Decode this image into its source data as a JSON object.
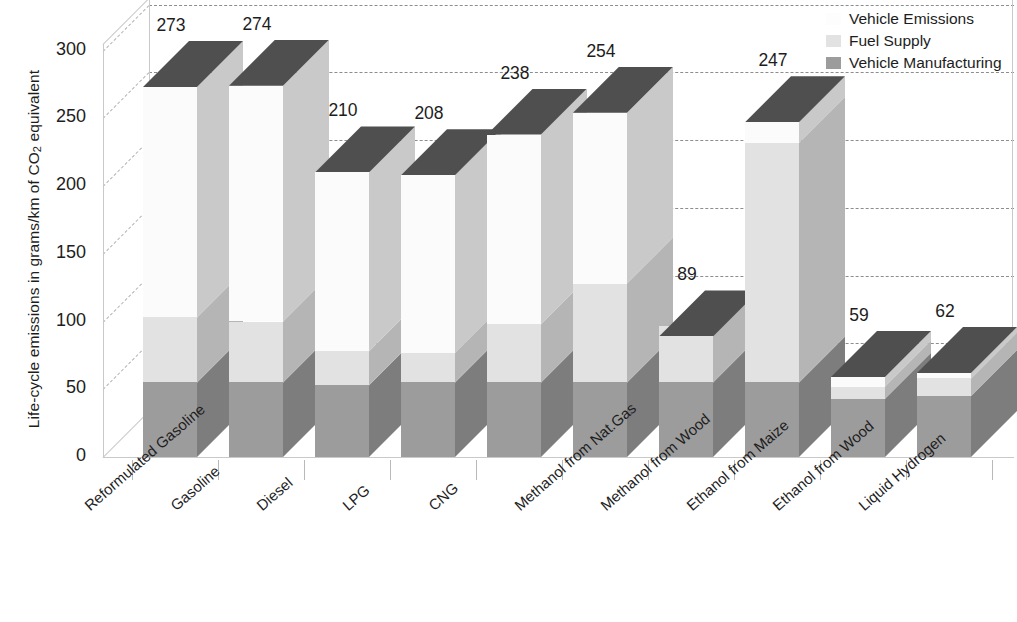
{
  "chart_data": {
    "type": "bar",
    "subtype": "stacked-3d-column",
    "title": "",
    "xlabel": "",
    "ylabel": "Life-cycle emissions in grams/km of CO2 equivalent",
    "ylabel_parts": {
      "pre": "Life-cycle emissions in grams/km of CO",
      "sub": "2",
      "post": " equivalent"
    },
    "ylim": [
      0,
      300
    ],
    "yticks": [
      0,
      50,
      100,
      150,
      200,
      250,
      300
    ],
    "ytick_labels": [
      "0",
      "50",
      "100",
      "150",
      "200",
      "250",
      "300"
    ],
    "grid": true,
    "grid_style": "dashed",
    "legend_position": "top-right",
    "categories": [
      "Reformulated Gasoline",
      "Gasoline",
      "Diesel",
      "LPG",
      "CNG",
      "Methanol from Nat.Gas",
      "Methanol from Wood",
      "Ethanol from Maize",
      "Ethanol from Wood",
      "Liquid Hydrogen"
    ],
    "series": [
      {
        "name": "Vehicle Manufacturing",
        "color": "#9c9c9c",
        "values": [
          55,
          55,
          53,
          55,
          55,
          55,
          55,
          55,
          43,
          45
        ]
      },
      {
        "name": "Fuel Supply",
        "color": "#e2e2e2",
        "values": [
          48,
          45,
          25,
          22,
          43,
          73,
          42,
          177,
          9,
          13
        ]
      },
      {
        "name": "Vehicle Emissions",
        "color": "#fbfbfb",
        "values": [
          170,
          174,
          132,
          131,
          140,
          126,
          -8,
          15,
          7,
          4
        ]
      }
    ],
    "totals": [
      273,
      274,
      210,
      208,
      238,
      254,
      89,
      247,
      59,
      62
    ],
    "total_labels": [
      "273",
      "274",
      "210",
      "208",
      "238",
      "254",
      "89",
      "247",
      "59",
      "62"
    ],
    "cap_color": "#4f4f4f",
    "side_shade_color": "#b5b5b5",
    "gridline_color": "#8d8d8d",
    "axis_color": "#c9c9c9",
    "text_color": "#1d1d1d",
    "background": "#ffffff"
  },
  "legend": {
    "items": [
      {
        "label": "Vehicle Emissions",
        "color": "#fbfbfb"
      },
      {
        "label": "Fuel Supply",
        "color": "#e2e2e2"
      },
      {
        "label": "Vehicle Manufacturing",
        "color": "#9c9c9c"
      }
    ]
  }
}
